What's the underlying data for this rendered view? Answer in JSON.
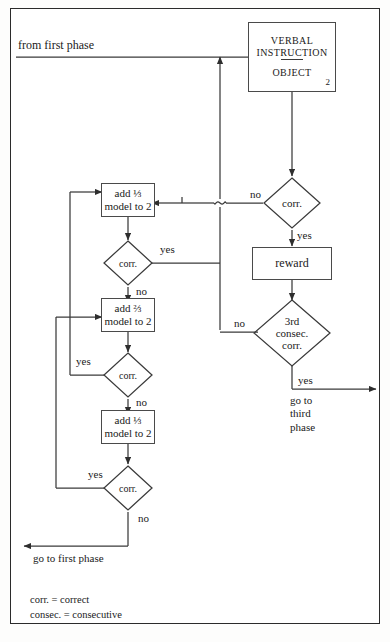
{
  "diagram": {
    "title_entry": "from first phase",
    "legend": [
      "corr. = correct",
      "consec. = consecutive"
    ],
    "nodes": {
      "verbal_instruction": {
        "line1": "VERBAL",
        "line2": "INSTRUCTION",
        "line3": "OBJECT",
        "corner_number": "2"
      },
      "reward": "reward",
      "add_third_1": {
        "line1": "add ⅓",
        "line2": "model to 2"
      },
      "add_third_2": {
        "line1": "add ⅔",
        "line2": "model to 2"
      },
      "add_third_3": {
        "line1": "add ⅓",
        "line2": "model to 2"
      },
      "decision_corr_right": "corr.",
      "decision_3rd": {
        "line1": "3rd",
        "line2": "consec.",
        "line3": "corr."
      },
      "decision_corr_a": "corr.",
      "decision_corr_b": "corr.",
      "decision_corr_c": "corr."
    },
    "edge_labels": {
      "right_corr_no": "no",
      "right_corr_yes": "yes",
      "third_no": "no",
      "third_yes": "yes",
      "a_yes": "yes",
      "a_no": "no",
      "b_yes": "yes",
      "b_no": "no",
      "c_yes": "yes",
      "c_no": "no"
    },
    "exits": {
      "third_phase": {
        "line1": "go to",
        "line2": "third",
        "line3": "phase"
      },
      "first_phase": "go to first phase"
    },
    "colors": {
      "stroke": "#3a3a3a",
      "box_border": "#4a4a4a",
      "text": "#1a1a1a",
      "frame": "#2b2b2b",
      "background": "#ffffff"
    }
  }
}
